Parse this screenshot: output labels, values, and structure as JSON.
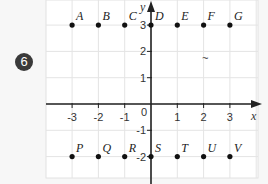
{
  "exercise": {
    "number": "6",
    "badge_color": "#3a3a3a"
  },
  "chart_data": {
    "type": "scatter",
    "title": "",
    "xlabel": "x",
    "ylabel": "y",
    "xlim": [
      -4,
      4
    ],
    "ylim": [
      -3,
      4
    ],
    "grid": true,
    "x_ticks": [
      "-3",
      "-2",
      "-1",
      "0",
      "1",
      "2",
      "3"
    ],
    "y_ticks": [
      "3",
      "2",
      "1",
      "-1",
      "-2"
    ],
    "points": [
      {
        "label": "A",
        "x": -3,
        "y": 3
      },
      {
        "label": "B",
        "x": -2,
        "y": 3
      },
      {
        "label": "C",
        "x": -1,
        "y": 3
      },
      {
        "label": "D",
        "x": 0,
        "y": 3
      },
      {
        "label": "E",
        "x": 1,
        "y": 3
      },
      {
        "label": "F",
        "x": 2,
        "y": 3
      },
      {
        "label": "G",
        "x": 3,
        "y": 3
      },
      {
        "label": "P",
        "x": -3,
        "y": -2
      },
      {
        "label": "Q",
        "x": -2,
        "y": -2
      },
      {
        "label": "R",
        "x": -1,
        "y": -2
      },
      {
        "label": "S",
        "x": 0,
        "y": -2
      },
      {
        "label": "T",
        "x": 1,
        "y": -2
      },
      {
        "label": "U",
        "x": 2,
        "y": -2
      },
      {
        "label": "V",
        "x": 3,
        "y": -2
      }
    ]
  }
}
